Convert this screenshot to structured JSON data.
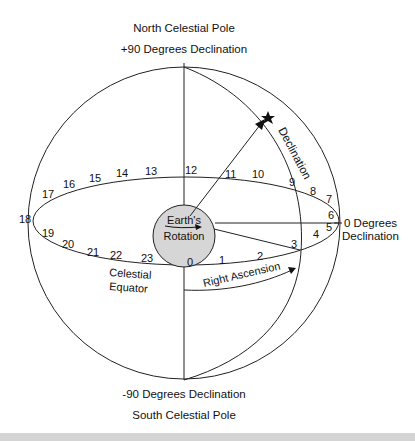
{
  "labels": {
    "north_pole": "North Celestial Pole",
    "north_decl": "+90 Degrees Declination",
    "south_decl": "-90 Degrees Declination",
    "south_pole": "South Celestial Pole",
    "zero_decl_1": "0 Degrees",
    "zero_decl_2": "Declination",
    "declination": "Declination",
    "earth_1": "Earth's",
    "earth_2": "Rotation",
    "equator_1": "Celestial",
    "equator_2": "Equator",
    "right_ascension": "Right Ascension"
  },
  "hours": {
    "h0": "0",
    "h1": "1",
    "h2": "2",
    "h3": "3",
    "h4": "4",
    "h5": "5",
    "h6": "6",
    "h7": "7",
    "h8": "8",
    "h9": "9",
    "h10": "10",
    "h11": "11",
    "h12": "12",
    "h13": "13",
    "h14": "14",
    "h15": "15",
    "h16": "16",
    "h17": "17",
    "h18": "18",
    "h19": "19",
    "h20": "20",
    "h21": "21",
    "h22": "22",
    "h23": "23"
  },
  "colors": {
    "line": "#222222",
    "earth_fill": "#d6d6d6",
    "bar": "#d4d4d4"
  }
}
